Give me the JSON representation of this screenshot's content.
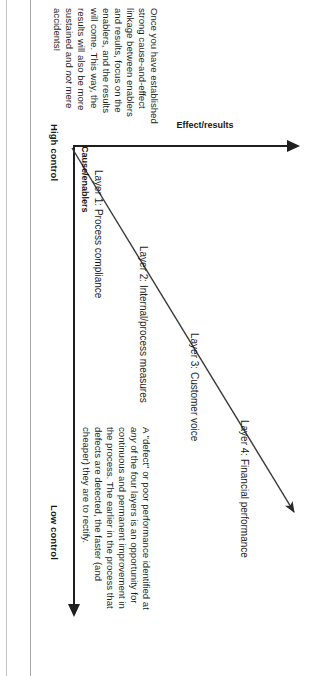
{
  "figure": {
    "type": "diagram",
    "axes": {
      "horizontal": {
        "name": "Cause/enablers",
        "left_caption": "High control",
        "right_caption": "Low control",
        "arrow_direction": "right"
      },
      "vertical": {
        "name": "Effect/results",
        "arrow_direction": "up"
      }
    },
    "layers": [
      {
        "id": 1,
        "label": "Layer 1: Process compliance"
      },
      {
        "id": 2,
        "label": "Layer 2: Internal/process measures"
      },
      {
        "id": 3,
        "label": "Layer 3: Customer voice"
      },
      {
        "id": 4,
        "label": "Layer 4: Financial performance"
      }
    ],
    "notes": {
      "defect": "A \"defect\" or poor performance identified at any of the four layers is an opportunity for continuous and permanent improvement in the process. The earlier in the process that defects are detected, the faster (and cheaper) they are to rectify.",
      "defect_italic_word": "any",
      "enablers": "Once you have established strong cause-and-effect linkage between enablers and results, focus on the enablers, and the results will come. This way, the results will also be more sustained and not mere accidents!",
      "enablers_italic_word": "not"
    },
    "colors": {
      "ink": "#1b1b1b",
      "axis": "#1f1f1f",
      "rule": "#b9b9b9",
      "background": "#ffffff"
    },
    "page_orientation": "rotated-90-clockwise"
  }
}
